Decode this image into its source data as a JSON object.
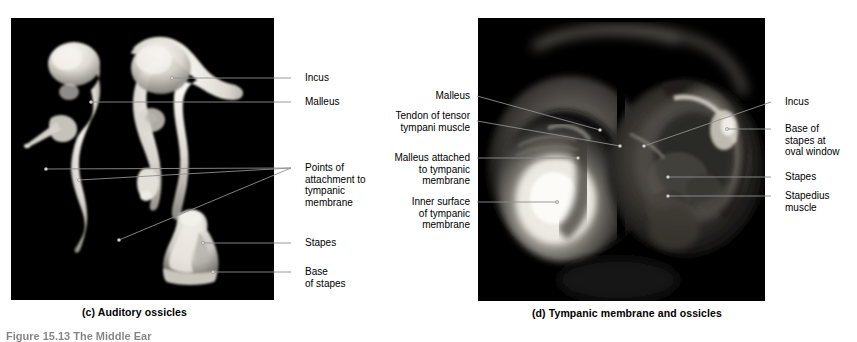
{
  "figure": {
    "caption": "Figure 15.13  The Middle Ear",
    "panels": [
      {
        "id": "c",
        "caption": "(c) Auditory ossicles"
      },
      {
        "id": "d",
        "caption": "(d) Tympanic membrane and ossicles"
      }
    ]
  },
  "panel_c": {
    "caption": "(c) Auditory ossicles",
    "labels": [
      {
        "key": "incus",
        "text": "Incus"
      },
      {
        "key": "malleus",
        "text": "Malleus"
      },
      {
        "key": "points",
        "text": "Points of\nattachment to\ntympanic\nmembrane"
      },
      {
        "key": "stapes",
        "text": "Stapes"
      },
      {
        "key": "base",
        "text": "Base\nof stapes"
      }
    ]
  },
  "panel_d": {
    "caption": "(d) Tympanic membrane and ossicles",
    "labels_left": [
      {
        "key": "malleus",
        "text": "Malleus"
      },
      {
        "key": "tendon",
        "text": "Tendon of tensor\ntympani muscle"
      },
      {
        "key": "malleus_attached",
        "text": "Malleus attached\nto tympanic\nmembrane"
      },
      {
        "key": "inner_surface",
        "text": "Inner surface\nof tympanic\nmembrane"
      }
    ],
    "labels_right": [
      {
        "key": "incus",
        "text": "Incus"
      },
      {
        "key": "base_oval",
        "text": "Base of\nstapes at\noval window"
      },
      {
        "key": "stapes",
        "text": "Stapes"
      },
      {
        "key": "stapedius",
        "text": "Stapedius\nmuscle"
      }
    ]
  },
  "colors": {
    "panel_background": "#000000",
    "page_background": "#ffffff",
    "leader_line": "#8f8f8f",
    "text": "#000000",
    "bone": "#e8e6e0"
  }
}
